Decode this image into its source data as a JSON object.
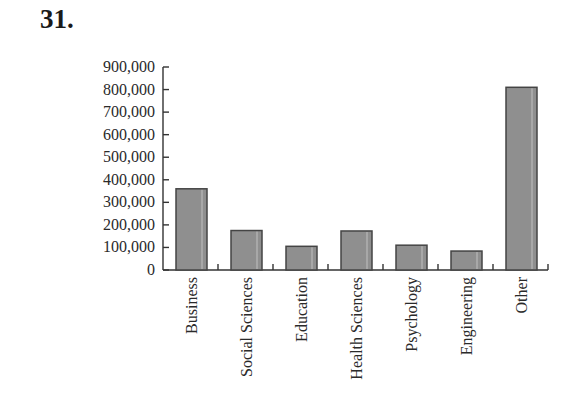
{
  "problem": {
    "number": "31."
  },
  "chart_data": {
    "type": "bar",
    "title": "",
    "xlabel": "",
    "ylabel": "",
    "categories": [
      "Business",
      "Social Sciences",
      "Education",
      "Health Sciences",
      "Psychology",
      "Engineering",
      "Other"
    ],
    "values": [
      360000,
      175000,
      105000,
      173000,
      110000,
      84000,
      810000
    ],
    "ylim": [
      0,
      900000
    ],
    "yticks": [
      0,
      100000,
      200000,
      300000,
      400000,
      500000,
      600000,
      700000,
      800000,
      900000
    ],
    "ytick_labels": [
      "0",
      "100,000",
      "200,000",
      "300,000",
      "400,000",
      "500,000",
      "600,000",
      "700,000",
      "800,000",
      "900,000"
    ],
    "grid": false,
    "legend": null,
    "bar_color": "#8f8f8f"
  }
}
